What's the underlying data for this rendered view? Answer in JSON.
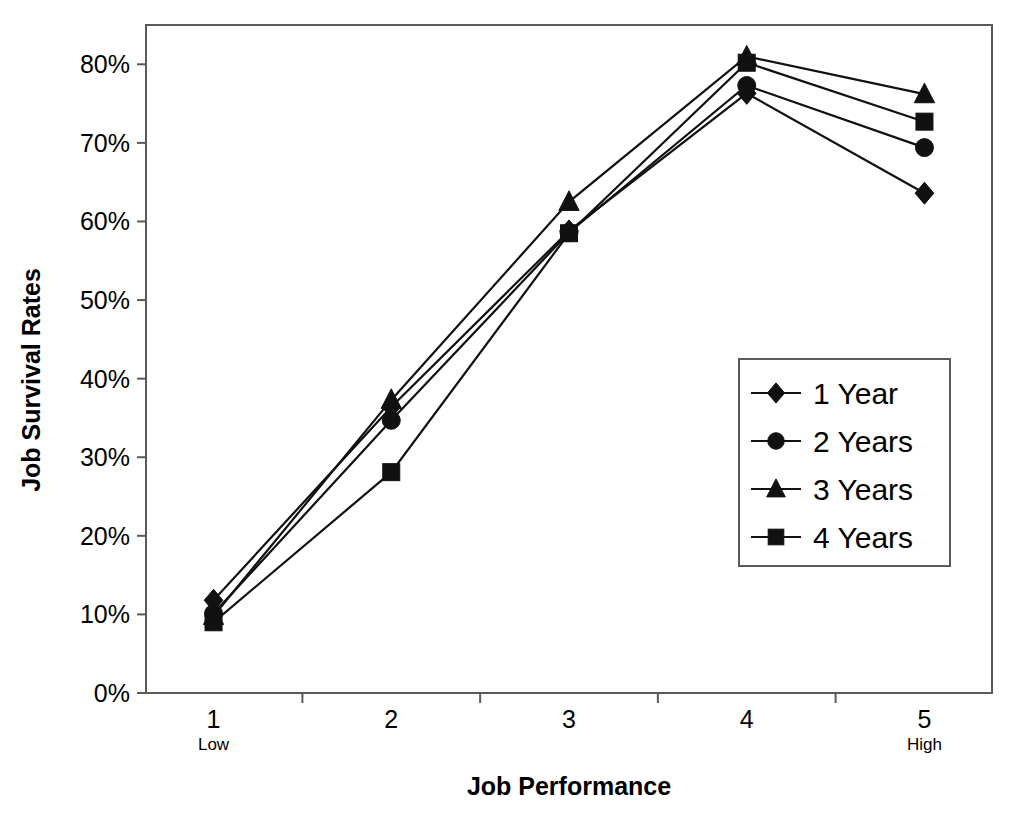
{
  "chart_data": {
    "type": "line",
    "title": "",
    "xlabel": "Job Performance",
    "ylabel": "Job Survival Rates",
    "x": [
      1,
      2,
      3,
      4,
      5
    ],
    "categories": [
      "1",
      "2",
      "3",
      "4",
      "5"
    ],
    "xtick_labels": [
      "1",
      "2",
      "3",
      "4",
      "5"
    ],
    "xtick_sublabels": [
      "Low",
      "",
      "",
      "",
      "High"
    ],
    "ytick_labels": [
      "0%",
      "10%",
      "20%",
      "30%",
      "40%",
      "50%",
      "60%",
      "70%",
      "80%"
    ],
    "ytick_values": [
      0,
      10,
      20,
      30,
      40,
      50,
      60,
      70,
      80
    ],
    "ylim": [
      0,
      85
    ],
    "xlim": [
      0.62,
      5.38
    ],
    "grid": false,
    "legend_position": "center-right",
    "series": [
      {
        "name": "1 Year",
        "marker": "diamond",
        "color": "#111111",
        "values": [
          11.8,
          36.4,
          58.8,
          76.3,
          63.6
        ]
      },
      {
        "name": "2 Years",
        "marker": "circle",
        "color": "#111111",
        "values": [
          10.1,
          34.7,
          58.6,
          77.3,
          69.4
        ]
      },
      {
        "name": "3 Years",
        "marker": "triangle",
        "color": "#111111",
        "values": [
          9.8,
          37.3,
          62.5,
          81.0,
          76.2
        ]
      },
      {
        "name": "4 Years",
        "marker": "square",
        "color": "#111111",
        "values": [
          9.0,
          28.1,
          58.5,
          80.2,
          72.7
        ]
      }
    ]
  },
  "legend": {
    "items": [
      {
        "label": "1 Year",
        "marker": "diamond"
      },
      {
        "label": "2 Years",
        "marker": "circle"
      },
      {
        "label": "3 Years",
        "marker": "triangle"
      },
      {
        "label": "4 Years",
        "marker": "square"
      }
    ]
  },
  "axes": {
    "x_title": "Job Performance",
    "y_title": "Job Survival Rates"
  }
}
